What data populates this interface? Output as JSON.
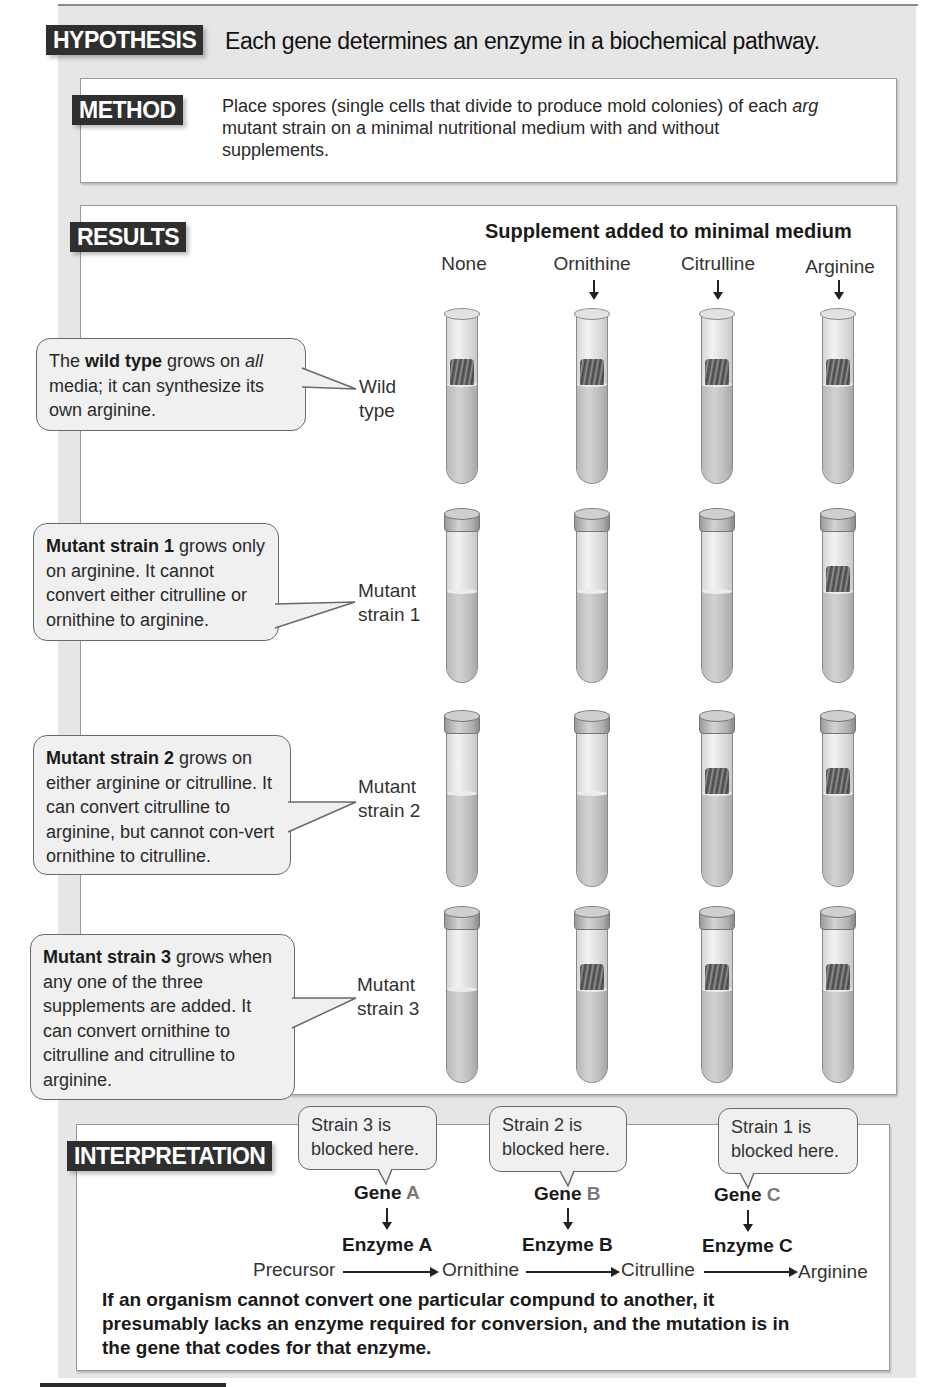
{
  "hypothesis": {
    "label": "HYPOTHESIS",
    "text": "Each gene determines an enzyme in a biochemical pathway."
  },
  "method": {
    "label": "METHOD",
    "text_before_italic": "Place spores (single cells that divide to produce mold colonies) of each ",
    "italic": "arg",
    "text_after_italic": " mutant strain on a minimal nutritional medium with and without supplements."
  },
  "results": {
    "label": "RESULTS",
    "supplement_title": "Supplement added to minimal medium",
    "columns": [
      "None",
      "Ornithine",
      "Citrulline",
      "Arginine"
    ],
    "rows": [
      {
        "label_line1": "Wild",
        "label_line2": "type",
        "bubble_bold": "wild type",
        "bubble_pre": "The ",
        "bubble_mid": " grows on ",
        "bubble_italic": "all",
        "bubble_post": " media; it can synthesize its own arginine.",
        "growth": [
          true,
          true,
          true,
          true
        ],
        "capped": false
      },
      {
        "label_line1": "Mutant",
        "label_line2": "strain 1",
        "bubble_bold": "Mutant strain 1",
        "bubble_text": " grows only on arginine. It cannot convert either citrulline or ornithine to arginine.",
        "growth": [
          false,
          false,
          false,
          true
        ],
        "capped": true
      },
      {
        "label_line1": "Mutant",
        "label_line2": "strain 2",
        "bubble_bold": "Mutant strain 2",
        "bubble_text": " grows on either arginine or citrulline. It can convert citrulline to arginine, but cannot con-vert ornithine to citrulline.",
        "growth": [
          false,
          false,
          true,
          true
        ],
        "capped": true
      },
      {
        "label_line1": "Mutant",
        "label_line2": "strain 3",
        "bubble_bold": "Mutant strain 3",
        "bubble_text": " grows when any one of the three supplements are added. It can convert ornithine to citrulline and citrulline to arginine.",
        "growth": [
          false,
          true,
          true,
          true
        ],
        "capped": true
      }
    ]
  },
  "interpretation": {
    "label": "INTERPRETATION",
    "blocks": [
      {
        "bubble_line1": "Strain 3 is",
        "bubble_line2": "blocked here.",
        "gene_word": "Gene",
        "gene_letter": "A",
        "enzyme_word": "Enzyme",
        "enzyme_letter": "A"
      },
      {
        "bubble_line1": "Strain 2 is",
        "bubble_line2": "blocked here.",
        "gene_word": "Gene",
        "gene_letter": "B",
        "enzyme_word": "Enzyme",
        "enzyme_letter": "B"
      },
      {
        "bubble_line1": "Strain 1 is",
        "bubble_line2": "blocked here.",
        "gene_word": "Gene",
        "gene_letter": "C",
        "enzyme_word": "Enzyme",
        "enzyme_letter": "C"
      }
    ],
    "pathway": [
      "Precursor",
      "Ornithine",
      "Citrulline",
      "Arginine"
    ],
    "conclusion": "If an organism cannot convert one particular compund to another, it presumably lacks an enzyme required for conversion, and the mutation is in the gene that codes for that enzyme."
  },
  "colors": {
    "label_bg": "#2f2f2f",
    "panel_bg": "#e6e6e6",
    "box_bg": "#ffffff",
    "bubble_bg": "#f0f0f0",
    "gene_letter": "#7a7a7a"
  }
}
